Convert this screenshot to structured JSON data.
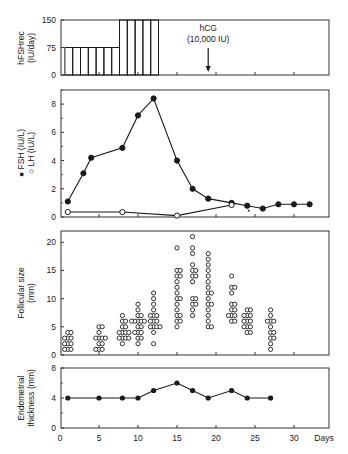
{
  "chart_data": [
    {
      "id": "hfsh",
      "type": "bar",
      "ylabel": "hFSHrec (IU/day)",
      "ylim": [
        0,
        150
      ],
      "yticks": [
        0,
        75,
        150
      ],
      "x": [
        1,
        2,
        3,
        4,
        5,
        6,
        7,
        8,
        9,
        10,
        11,
        12
      ],
      "values": [
        75,
        75,
        75,
        75,
        75,
        75,
        75,
        150,
        150,
        150,
        150,
        150
      ],
      "annotation": {
        "text_line1": "hCG",
        "text_line2": "(10,000 IU)",
        "day": 19
      }
    },
    {
      "id": "hormones",
      "type": "line",
      "ylabel_fsh": "FSH (IU/L)",
      "ylabel_lh": "LH (IU/L)",
      "ylim": [
        0,
        9
      ],
      "yticks": [
        0,
        2,
        4,
        6,
        8
      ],
      "series": [
        {
          "name": "FSH (IU/L)",
          "marker": "filled-circle",
          "x": [
            1,
            3,
            4,
            8,
            10,
            12,
            15,
            17,
            19,
            22,
            24,
            26,
            28,
            30,
            32
          ],
          "y": [
            1.1,
            3.1,
            4.2,
            4.9,
            7.2,
            8.4,
            4.0,
            2.0,
            1.3,
            1.0,
            0.8,
            0.6,
            0.9,
            0.9,
            0.9
          ]
        },
        {
          "name": "LH (IU/L)",
          "marker": "open-circle",
          "x": [
            1,
            8,
            15,
            22
          ],
          "y": [
            0.35,
            0.35,
            0.1,
            0.85
          ]
        }
      ]
    },
    {
      "id": "follicles",
      "type": "scatter",
      "ylabel": "Follicular size (mm)",
      "ylim": [
        0,
        22
      ],
      "yticks": [
        0,
        5,
        10,
        15,
        20
      ],
      "series": [
        {
          "day": 1,
          "sizes": [
            1,
            1,
            1,
            2,
            2,
            2,
            3,
            3,
            3,
            4,
            4
          ]
        },
        {
          "day": 5,
          "sizes": [
            1,
            1,
            1,
            2,
            2,
            3,
            3,
            3,
            3,
            4,
            5,
            5
          ]
        },
        {
          "day": 8,
          "sizes": [
            2,
            3,
            3,
            3,
            3,
            4,
            4,
            4,
            4,
            5,
            5,
            6,
            6,
            7
          ]
        },
        {
          "day": 10,
          "sizes": [
            2,
            3,
            3,
            4,
            4,
            4,
            5,
            5,
            6,
            6,
            6,
            6,
            6,
            7,
            7,
            8,
            9
          ]
        },
        {
          "day": 12,
          "sizes": [
            2,
            4,
            5,
            5,
            5,
            5,
            6,
            6,
            6,
            7,
            7,
            7,
            8,
            9,
            10,
            11
          ]
        },
        {
          "day": 15,
          "sizes": [
            5,
            6,
            6,
            7,
            7,
            8,
            9,
            10,
            10,
            11,
            12,
            13,
            14,
            14,
            15,
            15,
            19
          ]
        },
        {
          "day": 17,
          "sizes": [
            7,
            8,
            9,
            9,
            10,
            10,
            13,
            14,
            14,
            15,
            15,
            16,
            18,
            19,
            21
          ]
        },
        {
          "day": 19,
          "sizes": [
            5,
            5,
            6,
            7,
            8,
            9,
            9,
            10,
            11,
            11,
            12,
            13,
            14,
            15,
            16,
            17,
            18
          ]
        },
        {
          "day": 22,
          "sizes": [
            6,
            6,
            7,
            7,
            7,
            8,
            8,
            9,
            9,
            11,
            12,
            12,
            14
          ]
        },
        {
          "day": 24,
          "sizes": [
            4,
            4,
            5,
            5,
            5,
            6,
            6,
            6,
            7,
            7,
            7,
            8,
            8
          ]
        },
        {
          "day": 27,
          "sizes": [
            1,
            2,
            3,
            3,
            4,
            4,
            5,
            6,
            6,
            6,
            7,
            8
          ]
        }
      ]
    },
    {
      "id": "endometrium",
      "type": "line",
      "ylabel_line1": "Endometrial",
      "ylabel_line2": "thickness (mm)",
      "ylim": [
        0,
        8
      ],
      "yticks": [
        0,
        4,
        8
      ],
      "series": [
        {
          "name": "Endometrial thickness (mm)",
          "marker": "filled-circle",
          "x": [
            1,
            5,
            8,
            10,
            12,
            15,
            17,
            19,
            22,
            24,
            27
          ],
          "y": [
            4,
            4,
            4,
            4,
            5,
            6,
            5,
            4,
            5,
            4,
            4
          ]
        }
      ]
    }
  ],
  "x_axis": {
    "ticks": [
      0,
      5,
      10,
      15,
      20,
      25,
      30
    ],
    "label": "Days",
    "range": [
      0,
      33
    ]
  }
}
